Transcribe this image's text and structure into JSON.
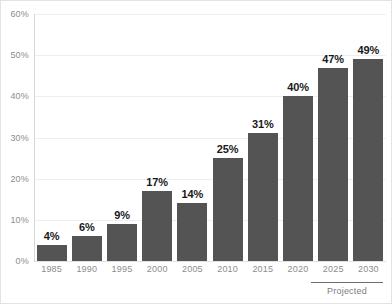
{
  "chart_data": {
    "type": "bar",
    "title": "",
    "subtitle": "",
    "xlabel": "",
    "ylabel": "",
    "ylim": [
      0,
      60
    ],
    "y_ticks": [
      0,
      10,
      20,
      30,
      40,
      50,
      60
    ],
    "y_tick_labels": [
      "0%",
      "10%",
      "20%",
      "30%",
      "40%",
      "50%",
      "60%"
    ],
    "grid": true,
    "legend": "none",
    "categories": [
      "1985",
      "1990",
      "1995",
      "2000",
      "2005",
      "2010",
      "2015",
      "2020",
      "2025",
      "2030"
    ],
    "values": [
      4,
      6,
      9,
      17,
      14,
      25,
      31,
      40,
      47,
      49
    ],
    "value_labels": [
      "4%",
      "6%",
      "9%",
      "17%",
      "14%",
      "25%",
      "31%",
      "40%",
      "47%",
      "49%"
    ],
    "annotations": [
      {
        "text": "Projected",
        "covers": [
          "2025",
          "2030"
        ],
        "style": "bracket-below-axis"
      }
    ],
    "colors": {
      "bar": "#545454",
      "grid": "#eeeeee",
      "axis": "#d8d8d8",
      "tick_text": "#8d8d8d",
      "value_text": "#1a1a1a",
      "annotation_text": "#7d7d7d",
      "annotation_rule": "#6d6d6d",
      "background": "#ffffff",
      "frame": "#e3e3e3"
    }
  }
}
